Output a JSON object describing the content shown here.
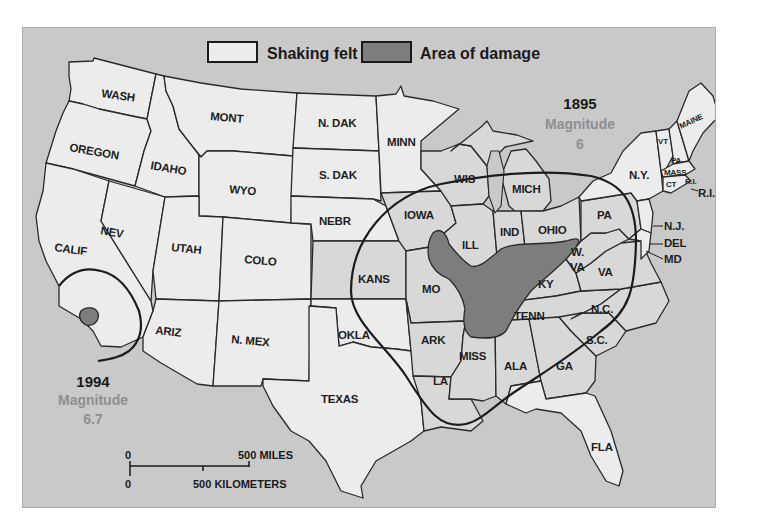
{
  "legend": {
    "items": [
      {
        "label": "Shaking felt",
        "swatch_color": "#ececec"
      },
      {
        "label": "Area of damage",
        "swatch_color": "#7d7d7d"
      }
    ]
  },
  "earthquakes": [
    {
      "year": "1895",
      "magnitude_label": "Magnitude",
      "magnitude": "6"
    },
    {
      "year": "1994",
      "magnitude_label": "Magnitude",
      "magnitude": "6.7"
    }
  ],
  "states": {
    "wash": "WASH",
    "oregon": "OREGON",
    "calif": "CALIF",
    "idaho": "IDAHO",
    "nev": "NEV",
    "mont": "MONT",
    "wyo": "WYO",
    "utah": "UTAH",
    "colo": "COLO",
    "ariz": "ARIZ",
    "nmex": "N. MEX",
    "ndak": "N. DAK",
    "sdak": "S. DAK",
    "nebr": "NEBR",
    "kans": "KANS",
    "okla": "OKLA",
    "texas": "TEXAS",
    "minn": "MINN",
    "iowa": "IOWA",
    "mo": "MO",
    "ark": "ARK",
    "la": "LA",
    "wis": "WIS",
    "ill": "ILL",
    "mich": "MICH",
    "ind": "IND",
    "ohio": "OHIO",
    "ky": "KY",
    "tenn": "TENN",
    "miss": "MISS",
    "ala": "ALA",
    "ga": "GA",
    "fla": "FLA",
    "sc": "S.C.",
    "nc": "N.C.",
    "va": "VA",
    "wva_1": "W.",
    "wva_2": "VA",
    "pa": "PA",
    "ny": "N.Y.",
    "vt": "VT",
    "nh": "PA",
    "maine": "MAINE",
    "mass": "MASS",
    "ct": "CT",
    "ri_small": "R.I.",
    "ri": "R.I.",
    "nj": "N.J.",
    "del": "DEL",
    "md": "MD"
  },
  "scale_bar": {
    "top_zero": "0",
    "miles_label": "500 MILES",
    "bottom_zero": "0",
    "km_label": "500 KILOMETERS"
  },
  "colors": {
    "ocean": "#c9c9c9",
    "land": "#ececec",
    "felt_land": "#d8d8d8",
    "damage": "#7d7d7d",
    "magnitude_text": "#8f8f8f"
  }
}
